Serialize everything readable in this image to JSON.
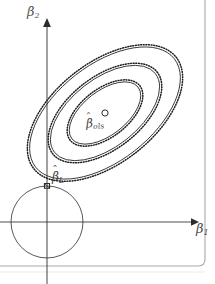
{
  "figure": {
    "kind": "constrained-regression-geometry-diagram",
    "background_color": "#ffffff",
    "ink_color": "#2b2b2b",
    "axis_color": "#3a3a3a",
    "frame_color": "#9a9a9a",
    "axes": {
      "origin_px": [
        47,
        222
      ],
      "y_axis": {
        "label": "β",
        "label_subscript": "2",
        "top_px": 20,
        "arrow": "up"
      },
      "x_axis": {
        "label": "β",
        "label_subscript": "1",
        "right_px": 194,
        "arrow": "right"
      }
    },
    "labels": {
      "ols_estimate": {
        "symbol": "β",
        "hat": "ˆ",
        "subscript": "ols",
        "marker": "o",
        "marker_px": [
          105,
          113
        ]
      },
      "constrained_estimate": {
        "symbol": "β",
        "hat": "ˆ",
        "subscript": "L",
        "marker": "tangency-point",
        "marker_px": [
          47,
          186
        ]
      }
    },
    "constraint_region": {
      "shape": "circle",
      "center_px": [
        47,
        222
      ],
      "radius_px": 36,
      "line_style": "solid",
      "stroke_width": 0.8
    },
    "contours": {
      "shape": "ellipse",
      "count": 3,
      "center_px": [
        105,
        113
      ],
      "rotation_deg": -38,
      "outline_texture": "solid-with-dotted-outer-edge",
      "rings": [
        {
          "rx": 88,
          "ry": 48
        },
        {
          "rx": 64,
          "ry": 34
        },
        {
          "rx": 42,
          "ry": 22
        }
      ]
    },
    "page_frame": {
      "right_edge_px": 205,
      "bottom_edge_px": 266,
      "corner": "rounded-bottom-right"
    }
  }
}
